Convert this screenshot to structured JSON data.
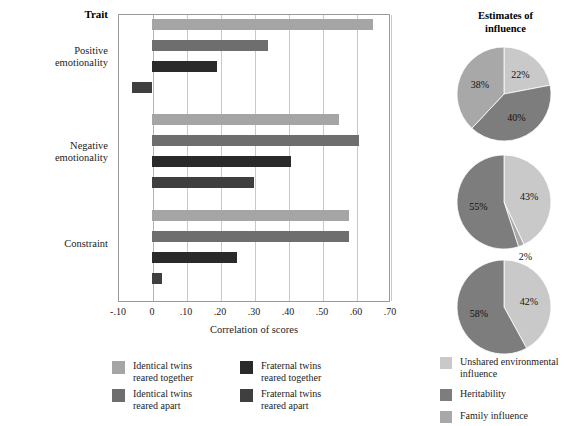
{
  "chart_data": {
    "type": "bar",
    "title": "",
    "orientation": "horizontal",
    "xlabel": "Correlation of scores",
    "ylabel": "Trait",
    "xlim": [
      -0.1,
      0.7
    ],
    "xticks": [
      "-.10",
      "0",
      ".10",
      ".20",
      ".30",
      ".40",
      ".50",
      ".60",
      ".70"
    ],
    "xtick_values": [
      -0.1,
      0,
      0.1,
      0.2,
      0.3,
      0.4,
      0.5,
      0.6,
      0.7
    ],
    "grid": "vertical",
    "categories": [
      "Positive emotionality",
      "Negative emotionality",
      "Constraint"
    ],
    "series": [
      {
        "name": "Identical twins reared together",
        "color": "#a5a5a5",
        "values": [
          0.65,
          0.55,
          0.58
        ]
      },
      {
        "name": "Identical twins reared apart",
        "color": "#6e6e6e",
        "values": [
          0.34,
          0.61,
          0.58
        ]
      },
      {
        "name": "Fraternal twins reared together",
        "color": "#2a2a2a",
        "values": [
          0.19,
          0.41,
          0.25
        ]
      },
      {
        "name": "Fraternal twins reared apart",
        "color": "#3f3f3f",
        "values": [
          -0.06,
          0.3,
          0.03
        ]
      }
    ],
    "legend_position": "bottom"
  },
  "pie_data": {
    "type": "pie",
    "title": "Estimates of influence",
    "legend_position": "bottom-right",
    "slice_colors": {
      "unshared_environmental_influence": "#c9c9c9",
      "heritability": "#7d7d7d",
      "family_influence": "#a8a8a8"
    },
    "legend": [
      {
        "label": "Unshared environmental influence",
        "color": "#c9c9c9"
      },
      {
        "label": "Heritability",
        "color": "#7d7d7d"
      },
      {
        "label": "Family influence",
        "color": "#a8a8a8"
      }
    ],
    "charts": [
      {
        "trait": "Positive emotionality",
        "slices": [
          {
            "key": "unshared_environmental_influence",
            "label": "22%",
            "value": 22,
            "color": "#c9c9c9"
          },
          {
            "key": "heritability",
            "label": "40%",
            "value": 40,
            "color": "#7d7d7d"
          },
          {
            "key": "family_influence",
            "label": "38%",
            "value": 38,
            "color": "#a8a8a8"
          }
        ]
      },
      {
        "trait": "Negative emotionality",
        "slices": [
          {
            "key": "unshared_environmental_influence",
            "label": "43%",
            "value": 43,
            "color": "#c9c9c9"
          },
          {
            "key": "family_influence",
            "label": "2%",
            "value": 2,
            "color": "#a8a8a8"
          },
          {
            "key": "heritability",
            "label": "55%",
            "value": 55,
            "color": "#7d7d7d"
          }
        ]
      },
      {
        "trait": "Constraint",
        "slices": [
          {
            "key": "unshared_environmental_influence",
            "label": "42%",
            "value": 42,
            "color": "#c9c9c9"
          },
          {
            "key": "heritability",
            "label": "58%",
            "value": 58,
            "color": "#7d7d7d"
          }
        ]
      }
    ]
  },
  "labels": {
    "trait_header": "Trait",
    "xaxis_title": "Correlation of scores",
    "pie_title_line1": "Estimates of",
    "pie_title_line2": "influence"
  },
  "bar_legend": [
    {
      "label": "Identical twins\nreared together",
      "color": "#a5a5a5"
    },
    {
      "label": "Fraternal twins\nreared together",
      "color": "#2a2a2a"
    },
    {
      "label": "Identical twins\nreared apart",
      "color": "#6e6e6e"
    },
    {
      "label": "Fraternal twins\nreared apart",
      "color": "#3f3f3f"
    }
  ],
  "trait_labels": [
    "Positive\nemotionality",
    "Negative\nemotionality",
    "Constraint"
  ]
}
